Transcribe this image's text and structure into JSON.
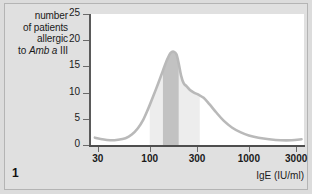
{
  "figure": {
    "number": "1",
    "background_color": "#dcdcdc",
    "panel_color": "#ffffff",
    "border_color": "#b4b4b4"
  },
  "axis_title": {
    "y_lines": [
      "number",
      "of patients",
      "allergic",
      "to "
    ],
    "y_line_italic": "Amb a",
    "y_line_tail": " III",
    "x": "IgE (IU/ml)"
  },
  "chart_data": {
    "type": "area",
    "title": "",
    "subtitle": "",
    "xlabel": "IgE (IU/ml)",
    "ylabel": "number of patients allergic to Amb a III",
    "xscale": "log",
    "xlim": [
      25,
      3600
    ],
    "ylim": [
      0,
      25
    ],
    "xticks": [
      30,
      100,
      300,
      1000,
      3000
    ],
    "xtick_labels": [
      "30",
      "100",
      "300",
      "1000",
      "3000"
    ],
    "yticks": [
      0,
      5,
      10,
      15,
      20,
      25
    ],
    "ytick_labels": [
      "0",
      "5",
      "10",
      "15",
      "20",
      "25"
    ],
    "grid": false,
    "legend": "none",
    "curve_color": "#b9b9b9",
    "fill_light_color": "#ededed",
    "fill_dark_color": "#c2c2c2",
    "series": [
      {
        "name": "number of patients allergic to Amb a III",
        "x": [
          28,
          33,
          40,
          48,
          57,
          66,
          76,
          86,
          96,
          108,
          122,
          136,
          150,
          163,
          175,
          186,
          196,
          207,
          220,
          236,
          255,
          280,
          310,
          350,
          400,
          470,
          560,
          680,
          830,
          1000,
          1250,
          1600,
          2100,
          2700,
          3400
        ],
        "values": [
          1.4,
          1.1,
          0.9,
          1.0,
          1.3,
          2.0,
          3.2,
          4.8,
          6.8,
          9.2,
          11.8,
          14.2,
          16.3,
          17.6,
          17.8,
          17.3,
          15.6,
          13.3,
          11.8,
          11.2,
          10.5,
          10.0,
          9.6,
          9.0,
          7.8,
          6.2,
          4.6,
          3.3,
          2.4,
          1.8,
          1.4,
          1.1,
          0.9,
          0.9,
          1.1
        ]
      }
    ],
    "shaded_bands": [
      {
        "name": "light-shaded-range",
        "color": "#ededed",
        "x_start": 100,
        "x_end": 320
      },
      {
        "name": "dark-shaded-range",
        "color": "#c2c2c2",
        "x_start": 136,
        "x_end": 196
      }
    ]
  }
}
